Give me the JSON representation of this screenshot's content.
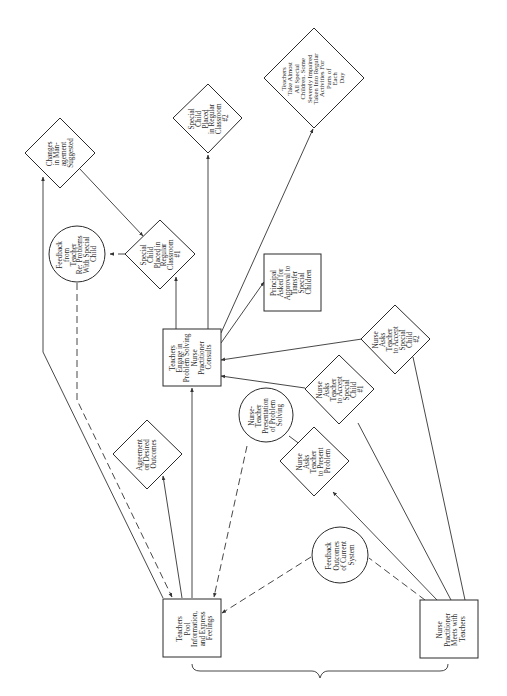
{
  "diagram": {
    "orientation": "rotated 90 degrees (text reads bottom-to-top)",
    "nodes": {
      "teachers_pool": {
        "shape": "rectangle",
        "lines": [
          "Teachers",
          "Pool",
          "Information,",
          "and Express",
          "Feelings"
        ]
      },
      "nurse_meets": {
        "shape": "rectangle",
        "lines": [
          "Nurse",
          "Practitioner",
          "Meets with",
          "Teachers"
        ]
      },
      "feedback_outcomes": {
        "shape": "circle",
        "lines": [
          "Feedback",
          "Outcomes",
          "of Current",
          "System"
        ]
      },
      "nurse_asks_present": {
        "shape": "diamond",
        "lines": [
          "Nurse",
          "Asks",
          "Teacher",
          "to Present",
          "Problem"
        ]
      },
      "nurse_teacher_presentation": {
        "shape": "circle",
        "lines": [
          "Nurse-",
          "Teacher",
          "Presentation",
          "of Problem",
          "Solving"
        ]
      },
      "agreement": {
        "shape": "diamond",
        "lines": [
          "Agreement",
          "on Desired",
          "Outcomes"
        ]
      },
      "teachers_engage": {
        "shape": "rectangle",
        "lines": [
          "Teachers",
          "Engage in",
          "Problem Solving",
          "Nurse",
          "Practitioner",
          "Consults"
        ]
      },
      "nurse_asks_accept_1": {
        "shape": "diamond",
        "lines": [
          "Nurse",
          "Asks",
          "Teacher",
          "to Accept",
          "Special",
          "Child",
          "#1"
        ]
      },
      "nurse_asks_accept_2": {
        "shape": "diamond",
        "lines": [
          "Nurse",
          "Asks",
          "Teacher",
          "to Accept",
          "Special",
          "Child",
          "#2"
        ]
      },
      "principal_asked": {
        "shape": "rectangle",
        "lines": [
          "Principal",
          "Asked for",
          "Approval to",
          "Transfer",
          "Special",
          "Children"
        ]
      },
      "special_child_1": {
        "shape": "diamond",
        "lines": [
          "Special",
          "Child",
          "Placed in",
          "Regular",
          "Classroom",
          "#1"
        ]
      },
      "special_child_2": {
        "shape": "diamond",
        "lines": [
          "Special",
          "Child",
          "Placed",
          "in Regular",
          "Classroom",
          "#2"
        ]
      },
      "feedback_teacher": {
        "shape": "circle",
        "lines": [
          "Feedback",
          "from",
          "Teacher",
          "Re: Problems",
          "With Special",
          "Child"
        ]
      },
      "changes_management": {
        "shape": "diamond",
        "lines": [
          "Changes",
          "in Man-",
          "agement",
          "Suggested"
        ]
      },
      "teachers_take_all": {
        "shape": "diamond",
        "lines": [
          "Teachers",
          "Take Almost",
          "All Special",
          "Children. Some",
          "Severely Impaired",
          "Taken Into Regular",
          "Activities For",
          "Parts of",
          "Each",
          "Day"
        ]
      }
    },
    "edges": [
      {
        "from": "nurse_meets",
        "to": "nurse_asks_present",
        "style": "solid",
        "arrow": true
      },
      {
        "from": "nurse_meets",
        "to": "nurse_asks_accept_1",
        "style": "solid",
        "arrow": false
      },
      {
        "from": "nurse_meets",
        "to": "nurse_asks_accept_2",
        "style": "solid",
        "arrow": false
      },
      {
        "from": "nurse_meets",
        "to": "feedback_outcomes",
        "style": "dashed",
        "arrow": false
      },
      {
        "from": "feedback_outcomes",
        "to": "teachers_pool",
        "style": "dashed",
        "arrow": true
      },
      {
        "from": "nurse_asks_present",
        "to": "nurse_teacher_presentation",
        "style": "solid",
        "arrow": false
      },
      {
        "from": "nurse_teacher_presentation",
        "to": "teachers_pool",
        "style": "dashed",
        "arrow": true
      },
      {
        "from": "teachers_pool",
        "to": "agreement",
        "style": "solid",
        "arrow": true
      },
      {
        "from": "teachers_pool",
        "to": "teachers_engage",
        "style": "solid",
        "arrow": true
      },
      {
        "from": "teachers_pool",
        "to": "changes_management",
        "style": "solid",
        "arrow": true
      },
      {
        "from": "feedback_teacher",
        "to": "teachers_pool",
        "style": "dashed",
        "arrow": true
      },
      {
        "from": "nurse_asks_accept_1",
        "to": "teachers_engage",
        "style": "solid",
        "arrow": true
      },
      {
        "from": "nurse_asks_accept_2",
        "to": "teachers_engage",
        "style": "solid",
        "arrow": true
      },
      {
        "from": "teachers_engage",
        "to": "special_child_1",
        "style": "solid",
        "arrow": true
      },
      {
        "from": "teachers_engage",
        "to": "special_child_2",
        "style": "solid",
        "arrow": true
      },
      {
        "from": "teachers_engage",
        "to": "principal_asked",
        "style": "solid",
        "arrow": true
      },
      {
        "from": "teachers_engage",
        "to": "teachers_take_all",
        "style": "solid",
        "arrow": true
      },
      {
        "from": "special_child_1",
        "to": "feedback_teacher",
        "style": "dashed",
        "arrow": true
      },
      {
        "from": "changes_management",
        "to": "special_child_1",
        "style": "solid",
        "arrow": true
      }
    ],
    "brace": {
      "spans": [
        "teachers_pool",
        "nurse_meets"
      ],
      "position": "bottom"
    }
  }
}
